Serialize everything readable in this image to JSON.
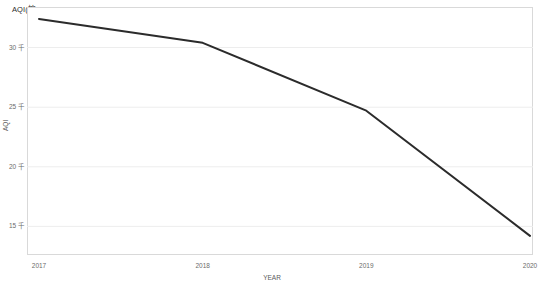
{
  "chart_data": {
    "type": "line",
    "title": "AQI(按 YEAR)",
    "xlabel": "YEAR",
    "ylabel": "AQI",
    "categories": [
      "2017",
      "2018",
      "2019",
      "2020"
    ],
    "x": [
      2017,
      2018,
      2019,
      2020
    ],
    "series": [
      {
        "name": "AQI",
        "values": [
          32400,
          30400,
          24700,
          14200
        ]
      }
    ],
    "ytick_labels": [
      "30 千",
      "25 千",
      "20 千",
      "15 千"
    ],
    "ytick_values": [
      30000,
      25000,
      20000,
      15000
    ],
    "xtick_labels": [
      "2017",
      "2018",
      "2019",
      "2020"
    ],
    "ylim": [
      12600,
      33400
    ],
    "xlim": [
      2017,
      2020
    ],
    "grid": true,
    "grid_axis": "y",
    "legend": false,
    "legend_position": "none",
    "line_color": "#2b2b2b",
    "grid_color": "#ededed",
    "frame_color": "#d9d9d9",
    "background_color": "#ffffff"
  }
}
